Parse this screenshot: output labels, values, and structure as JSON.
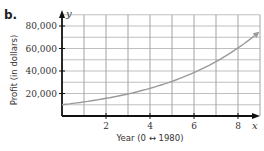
{
  "part_label": "b.",
  "chart_data": {
    "type": "line",
    "title": "",
    "xlabel": "Year (0 ↔ 1980)",
    "ylabel": "Profit (in dollars)",
    "x_axis_var": "x",
    "y_axis_var": "y",
    "xlim": [
      0,
      9
    ],
    "ylim": [
      0,
      90000
    ],
    "x_ticks": [
      2,
      4,
      6,
      8
    ],
    "x_tick_labels": [
      "2",
      "4",
      "6",
      "8"
    ],
    "y_ticks": [
      20000,
      40000,
      60000,
      80000
    ],
    "y_tick_labels": [
      "20,000",
      "40,000",
      "60,000",
      "80,000"
    ],
    "grid": true,
    "grid_x_step": 1,
    "grid_y_step": 10000,
    "series": [
      {
        "name": "Profit",
        "x": [
          0,
          1,
          2,
          3,
          4,
          5,
          6,
          7,
          8,
          8.9
        ],
        "values": [
          10000,
          12500,
          15700,
          19600,
          24600,
          30800,
          38600,
          48300,
          60500,
          73700
        ],
        "arrow_end": true
      }
    ],
    "colors": {
      "curve": "#9a9a9a",
      "grid": "#8a8a8a",
      "axis": "#111111"
    }
  }
}
